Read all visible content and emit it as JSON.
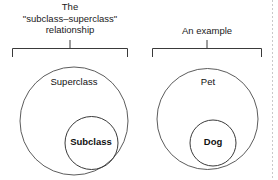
{
  "diagram": {
    "type": "euler-set-diagram",
    "background_color": "#ffffff",
    "stroke_color": "#3a3a3a",
    "text_color": "#111111",
    "groups": [
      {
        "id": "concept",
        "caption_lines": [
          "The",
          "\"subclass–superclass\"",
          "relationship"
        ],
        "outer_label": "Superclass",
        "inner_label": "Subclass"
      },
      {
        "id": "example",
        "caption_lines": [
          "An example"
        ],
        "outer_label": "Pet",
        "inner_label": "Dog"
      }
    ]
  },
  "captions": {
    "left_line1": "The",
    "left_line2": "\"subclass–superclass\"",
    "left_line3": "relationship",
    "right_line1": "An example"
  },
  "labels": {
    "superclass": "Superclass",
    "subclass": "Subclass",
    "pet": "Pet",
    "dog": "Dog"
  }
}
